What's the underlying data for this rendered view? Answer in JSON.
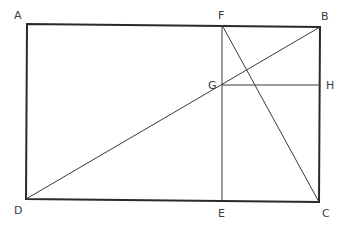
{
  "diagram": {
    "type": "geometric-construction",
    "points": {
      "A": {
        "label": "A",
        "x": 27,
        "y": 24
      },
      "B": {
        "label": "B",
        "x": 320,
        "y": 27
      },
      "C": {
        "label": "C",
        "x": 319,
        "y": 202
      },
      "D": {
        "label": "D",
        "x": 26,
        "y": 199
      },
      "E": {
        "label": "E",
        "x": 222,
        "y": 201
      },
      "F": {
        "label": "F",
        "x": 222,
        "y": 25
      },
      "G": {
        "label": "G",
        "x": 222,
        "y": 85
      },
      "H": {
        "label": "H",
        "x": 320,
        "y": 85
      }
    },
    "segments": [
      {
        "from": "A",
        "to": "B",
        "weight": "thick"
      },
      {
        "from": "B",
        "to": "C",
        "weight": "thick"
      },
      {
        "from": "C",
        "to": "D",
        "weight": "thick"
      },
      {
        "from": "D",
        "to": "A",
        "weight": "thick"
      },
      {
        "from": "F",
        "to": "E",
        "weight": "thin"
      },
      {
        "from": "G",
        "to": "H",
        "weight": "thin"
      },
      {
        "from": "D",
        "to": "B",
        "weight": "thin"
      },
      {
        "from": "F",
        "to": "C",
        "weight": "thin"
      }
    ],
    "labels": {
      "A": "A",
      "B": "B",
      "C": "C",
      "D": "D",
      "E": "E",
      "F": "F",
      "G": "G",
      "H": "H"
    },
    "colors": {
      "line": "#2a2a2a",
      "label": "#3c3c3c",
      "background": "#ffffff"
    }
  }
}
